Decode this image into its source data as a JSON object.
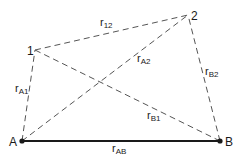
{
  "diagram": {
    "points": {
      "A": {
        "label": "A",
        "x": 22,
        "y": 141
      },
      "B": {
        "label": "B",
        "x": 220,
        "y": 141
      },
      "p1": {
        "label": "1",
        "x": 35,
        "y": 50
      },
      "p2": {
        "label": "2",
        "x": 188,
        "y": 15
      }
    },
    "edges": [
      {
        "id": "rAB",
        "from": "A",
        "to": "B",
        "style": "solid-thick",
        "label": "r",
        "sub": "AB"
      },
      {
        "id": "rA1",
        "from": "A",
        "to": "1",
        "style": "dashed",
        "label": "r",
        "sub": "A1"
      },
      {
        "id": "rA2",
        "from": "A",
        "to": "2",
        "style": "dashed",
        "label": "r",
        "sub": "A2"
      },
      {
        "id": "rB1",
        "from": "B",
        "to": "1",
        "style": "dashed",
        "label": "r",
        "sub": "B1"
      },
      {
        "id": "rB2",
        "from": "B",
        "to": "2",
        "style": "dashed",
        "label": "r",
        "sub": "B2"
      },
      {
        "id": "r12",
        "from": "1",
        "to": "2",
        "style": "dashed",
        "label": "r",
        "sub": "12"
      }
    ],
    "colors": {
      "line": "#1a1a1a",
      "dashed": "#555555",
      "background": "#ffffff"
    }
  }
}
